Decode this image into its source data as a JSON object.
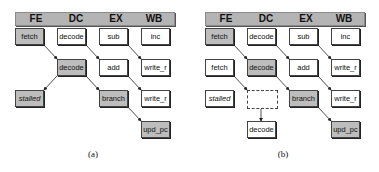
{
  "stages": [
    "FE",
    "DC",
    "EX",
    "WB"
  ],
  "colors": {
    "shaded": "#bdbdbd",
    "header": "#b4b4b4",
    "border": "#444444"
  },
  "panel_a": {
    "caption": "(a)",
    "boxes": {
      "r1c1": "fetch",
      "r1c2": "decode",
      "r1c3": "sub",
      "r1c4": "inc",
      "r2c2": "decode",
      "r2c3": "add",
      "r2c4": "write_r",
      "r3c1": "stalled",
      "r3c3": "branch",
      "r3c4": "write_r",
      "r4c4": "upd_pc"
    }
  },
  "panel_b": {
    "caption": "(b)",
    "boxes": {
      "r1c1": "fetch",
      "r1c2": "decode",
      "r1c3": "sub",
      "r1c4": "inc",
      "r2c1": "fetch",
      "r2c2": "decode",
      "r2c3": "add",
      "r2c4": "write_r",
      "r3c1": "stalled",
      "r3c2": "",
      "r3c3": "branch",
      "r3c4": "write_r",
      "r4c2": "decode",
      "r4c4": "upd_pc"
    }
  }
}
